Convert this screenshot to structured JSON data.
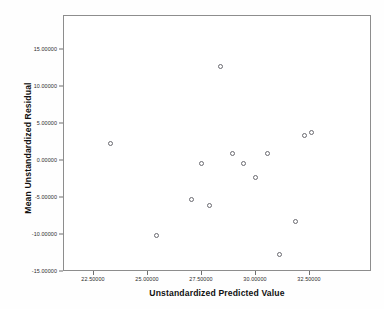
{
  "chart_data": {
    "type": "scatter",
    "title": "",
    "xlabel": "Unstandardized Predicted Value",
    "ylabel": "Mean Unstandardized Residual",
    "xlim": [
      21.2,
      34.0
    ],
    "ylim": [
      -15.0,
      18.0
    ],
    "grid": false,
    "legend": null,
    "xticks": [
      22.5,
      25.0,
      27.5,
      30.0,
      32.5
    ],
    "xtick_labels": [
      "22.50000",
      "25.00000",
      "27.50000",
      "30.00000",
      "32.50000"
    ],
    "yticks": [
      15.0,
      10.0,
      5.0,
      0.0,
      -5.0,
      -10.0,
      -15.0
    ],
    "ytick_labels": [
      "15.00000",
      "10.00000",
      "5.00000",
      "0.00000",
      "-5.00000",
      "-10.00000",
      "-15.00000"
    ],
    "marker": "open-circle",
    "marker_color": "#6a6a70",
    "points": [
      {
        "x": 23.3,
        "y": 2.35
      },
      {
        "x": 25.4,
        "y": -10.15
      },
      {
        "x": 27.05,
        "y": -5.25
      },
      {
        "x": 27.5,
        "y": -0.35
      },
      {
        "x": 27.85,
        "y": -6.1
      },
      {
        "x": 28.4,
        "y": 12.7
      },
      {
        "x": 28.95,
        "y": 0.9
      },
      {
        "x": 29.45,
        "y": -0.35
      },
      {
        "x": 30.0,
        "y": -2.25
      },
      {
        "x": 30.55,
        "y": 1.0
      },
      {
        "x": 31.1,
        "y": -12.65
      },
      {
        "x": 31.85,
        "y": -8.3
      },
      {
        "x": 32.25,
        "y": 3.35
      },
      {
        "x": 32.6,
        "y": 3.85
      }
    ]
  },
  "axes": {
    "x_title": "Unstandardized Predicted Value",
    "y_title": "Mean Unstandardized Residual"
  }
}
